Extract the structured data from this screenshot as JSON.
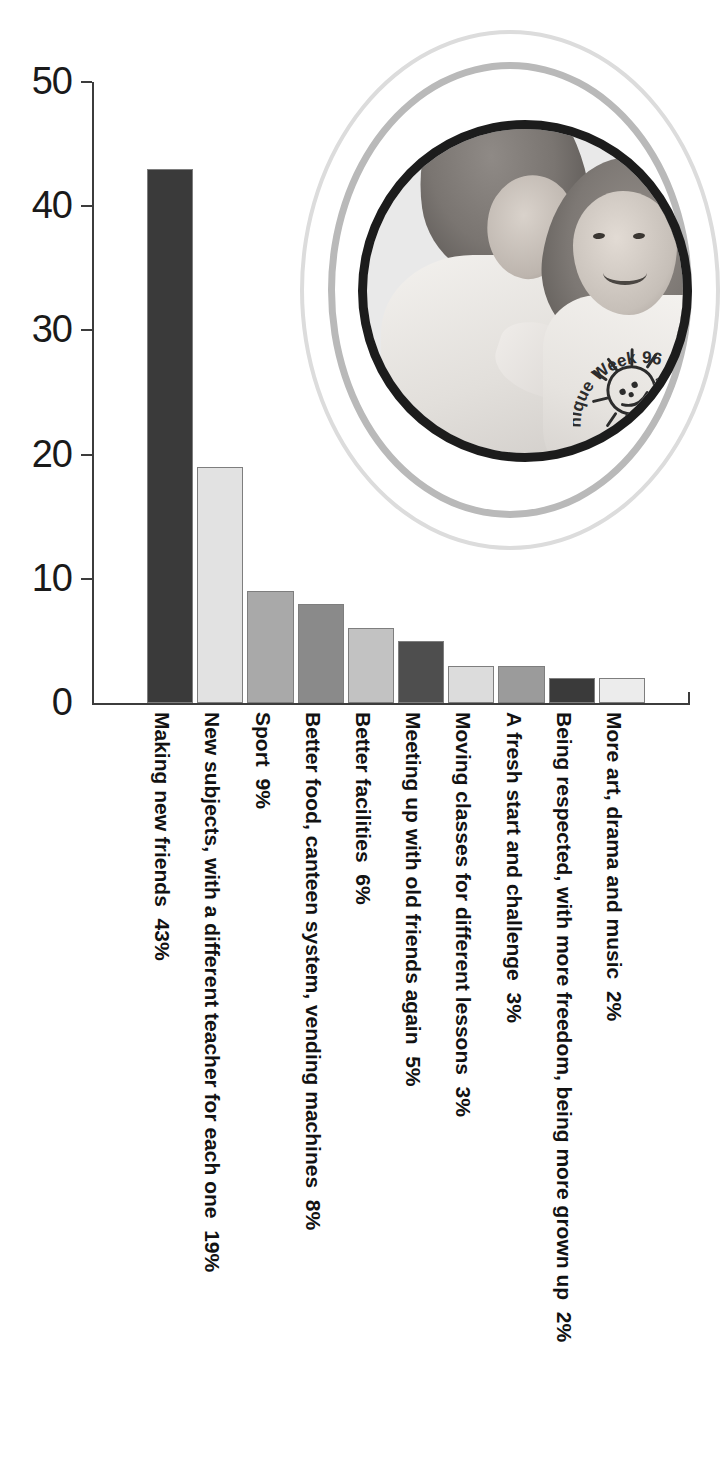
{
  "chart_data": {
    "type": "bar",
    "title": "",
    "xlabel": "",
    "ylabel": "",
    "ylim": [
      0,
      50
    ],
    "yticks": [
      0,
      10,
      20,
      30,
      40,
      50
    ],
    "ytick_labels": [
      "0",
      "10",
      "20",
      "30",
      "40",
      "50"
    ],
    "grid": false,
    "legend": "none",
    "categories": [
      "Making new friends",
      "New subjects, with a different teacher for each one",
      "Sport",
      "Better food, canteen system, vending machines",
      "Better facilities",
      "Meeting up with old friends again",
      "Moving classes for different lessons",
      "A fresh start and challenge",
      "Being respected, with more freedom, being more grown up",
      "More art, drama and music"
    ],
    "values": [
      43,
      19,
      9,
      8,
      6,
      5,
      3,
      3,
      2,
      2
    ],
    "value_labels": [
      "43%",
      "19%",
      "9%",
      "8%",
      "6%",
      "5%",
      "3%",
      "3%",
      "2%",
      "2%"
    ],
    "bar_colors": [
      "#3a3a3a",
      "#e2e2e2",
      "#a9a9a9",
      "#8a8a8a",
      "#c2c2c2",
      "#4e4e4e",
      "#dcdcdc",
      "#9b9b9b",
      "#3a3a3a",
      "#ececec"
    ],
    "axis_color": "#3c3c3c"
  },
  "photo": {
    "caption_on_shirt_line1": "nique Week",
    "caption_on_shirt_line2": "96",
    "ring_colors": [
      "#dcdcdc",
      "#b9b9b9",
      "#1c1c1c"
    ]
  }
}
